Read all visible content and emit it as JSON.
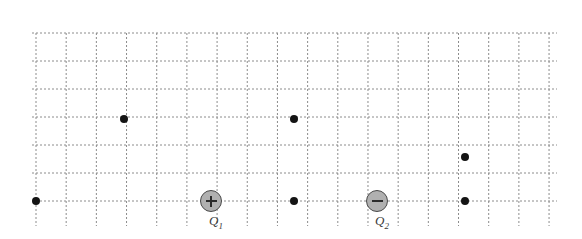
{
  "diagram": {
    "background_color": "#ffffff",
    "grid": {
      "line_color": "#8c8c8c",
      "line_style": "dashed",
      "dash_pattern": "2,2",
      "line_width": 1,
      "x_start": 36,
      "x_end": 549,
      "x_spacing": 30.18,
      "y_start": 33,
      "y_end": 201,
      "y_spacing": 28.0,
      "vertical_line_count": 18,
      "horizontal_line_count": 7,
      "vertical_overhang_bottom": 25,
      "horizontal_overhang_right": 8,
      "horizontal_overhang_left": 4
    },
    "charges": [
      {
        "id": "Q1",
        "label": "Q",
        "subscript": "1",
        "sign": "+",
        "sign_name": "plus-sign",
        "x": 211,
        "y": 201,
        "radius": 11,
        "fill_color": "#b0b0b0",
        "stroke_color": "#4a4a4a"
      },
      {
        "id": "Q2",
        "label": "Q",
        "subscript": "2",
        "sign": "−",
        "sign_name": "minus-sign",
        "x": 377,
        "y": 201,
        "radius": 11,
        "fill_color": "#b0b0b0",
        "stroke_color": "#4a4a4a"
      }
    ],
    "points": [
      {
        "id": "P1",
        "x": 36,
        "y": 201,
        "radius": 4.0,
        "color": "#141414"
      },
      {
        "id": "P2",
        "x": 124,
        "y": 119,
        "radius": 4.0,
        "color": "#141414"
      },
      {
        "id": "P3",
        "x": 294,
        "y": 119,
        "radius": 4.0,
        "color": "#141414"
      },
      {
        "id": "P4",
        "x": 465,
        "y": 157,
        "radius": 4.0,
        "color": "#141414"
      },
      {
        "id": "P5",
        "x": 294,
        "y": 201,
        "radius": 4.0,
        "color": "#141414"
      },
      {
        "id": "P6",
        "x": 465,
        "y": 201,
        "radius": 4.0,
        "color": "#141414"
      }
    ]
  }
}
